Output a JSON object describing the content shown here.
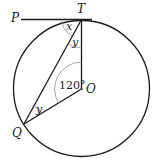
{
  "diagram": {
    "points": {
      "P": "P",
      "T": "T",
      "O": "O",
      "Q": "Q"
    },
    "angles": {
      "PTQ": "x",
      "QTO": "y",
      "TQO": "y",
      "TOQ": "120°"
    },
    "colors": {
      "stroke": "#1a1a1a",
      "arc": "#9a9a9a",
      "background": "#ffffff"
    }
  }
}
